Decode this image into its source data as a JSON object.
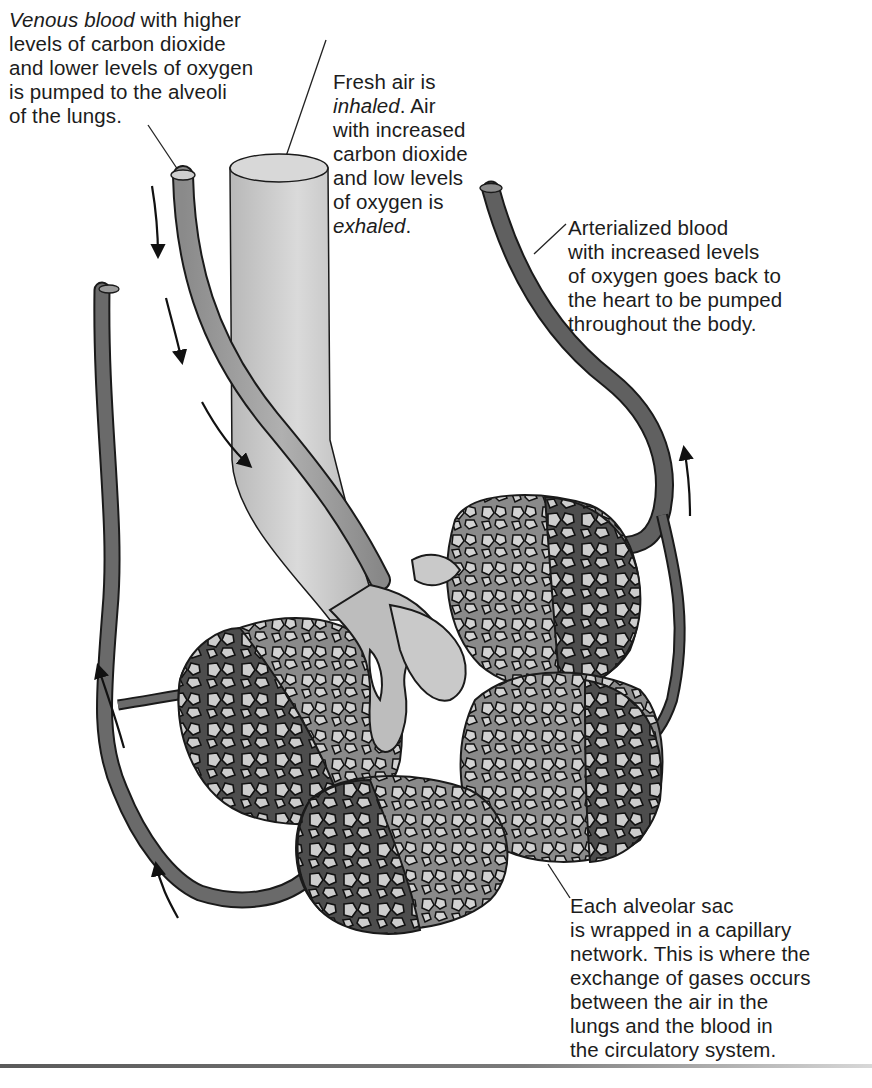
{
  "figure": {
    "type": "anatomical diagram",
    "colors": {
      "venous_vessel": "#9a9a9a",
      "arterial_vessel": "#5e5e5e",
      "airway": "#c9c9c9",
      "capillary_dark": "#4a4a4a",
      "capillary_light": "#8c8c8c",
      "alveolus_fill": "#cfcfcf",
      "outline": "#1a1a1a"
    }
  },
  "labels": {
    "venous": {
      "line1_italic": "Venous blood",
      "line1_rest": " with higher",
      "line2": "levels of carbon dioxide",
      "line3": "and lower levels of oxygen",
      "line4": "is pumped to the alveoli",
      "line5": "of the lungs."
    },
    "air": {
      "line1": "Fresh air is",
      "line2_italic": "inhaled",
      "line2_rest": ". Air",
      "line3": "with increased",
      "line4": "carbon dioxide",
      "line5": "and low levels",
      "line6": "of oxygen is",
      "line7_italic": "exhaled",
      "line7_rest": "."
    },
    "arterial": {
      "line1": "Arterialized blood",
      "line2": "with increased levels",
      "line3": "of oxygen goes back to",
      "line4": "the heart to be pumped",
      "line5": "throughout the body."
    },
    "alveolar": {
      "line1": "Each alveolar sac",
      "line2": "is wrapped in a capillary",
      "line3": "network. This is where the",
      "line4": "exchange of gases occurs",
      "line5": "between the air in the",
      "line6": "lungs and the blood in",
      "line7": "the circulatory system."
    }
  },
  "flow_arrows": [
    {
      "id": "venous-in-1",
      "direction": "down"
    },
    {
      "id": "venous-in-2",
      "direction": "down"
    },
    {
      "id": "venous-in-3",
      "direction": "down-right"
    },
    {
      "id": "left-return-1",
      "direction": "up"
    },
    {
      "id": "left-return-2",
      "direction": "up"
    },
    {
      "id": "arterial-out",
      "direction": "up"
    }
  ]
}
